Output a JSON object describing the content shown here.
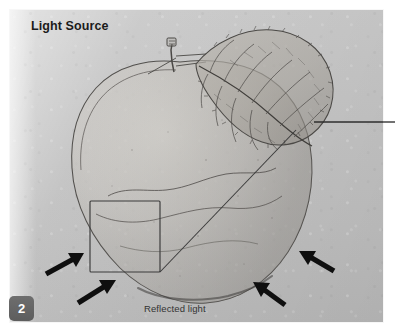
{
  "page": {
    "number_badge": "2",
    "background_color": "#ffffff",
    "panel_color": "#c4c4c4"
  },
  "labels": {
    "light_source": "Light Source",
    "reflected_light": "Reflected light"
  },
  "drawing": {
    "subject": "apple-pencil-sketch",
    "medium": "graphite pencil on toned paper",
    "stroke_color": "#4a4a4a",
    "annotation_color": "#111111",
    "elements": [
      "apple-outline",
      "apple-leaf",
      "apple-stem",
      "core-shadow-contour",
      "highlight-region-rectangle",
      "terminator-diagonal-line",
      "cast-shadow",
      "callout-leader-line",
      "reflected-light-arrows"
    ]
  },
  "annotations": {
    "arrows": [
      {
        "name": "reflected-light-arrow-left-upper",
        "direction": "up-right"
      },
      {
        "name": "reflected-light-arrow-left-lower",
        "direction": "up-right"
      },
      {
        "name": "reflected-light-arrow-right-upper",
        "direction": "up-left"
      },
      {
        "name": "reflected-light-arrow-right-lower",
        "direction": "up-left"
      }
    ],
    "highlight_rect": {
      "name": "highlight-region-rectangle"
    },
    "leader_line": {
      "name": "callout-leader-line",
      "points_to": "leaf-tip"
    }
  }
}
